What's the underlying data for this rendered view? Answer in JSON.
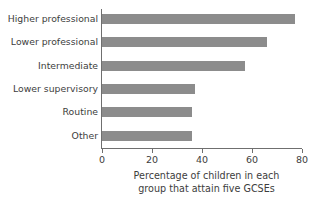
{
  "chart_data": {
    "type": "bar",
    "orientation": "horizontal",
    "title": "",
    "xlabel": "Percentage of children in each group that attain five GCSEs",
    "xlabel_lines": [
      "Percentage of children in each",
      "group that attain five GCSEs"
    ],
    "ylabel": "",
    "categories": [
      "Higher professional",
      "Lower professional",
      "Intermediate",
      "Lower supervisory",
      "Routine",
      "Other"
    ],
    "values": [
      77,
      66,
      57,
      37,
      36,
      36
    ],
    "xlim": [
      0,
      80
    ],
    "ylim": null,
    "xticks": [
      0,
      20,
      40,
      60,
      80
    ],
    "xtick_labels": [
      "0",
      "20",
      "40",
      "60",
      "80"
    ],
    "grid": false,
    "legend": null,
    "bar_color": "#8c8c8c",
    "axis_color": "#6f6f6f",
    "text_color": "#3d3d3d",
    "background": "#ffffff"
  }
}
